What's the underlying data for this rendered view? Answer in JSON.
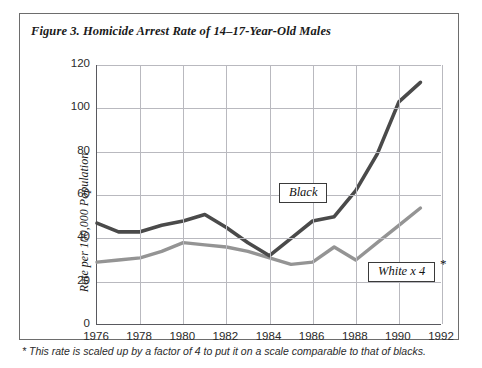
{
  "figure": {
    "title": "Figure 3. Homicide Arrest Rate of 14–17-Year-Old Males",
    "footnote": "* This rate is scaled up by a factor of 4 to put it on a scale comparable to that of blacks."
  },
  "labels": {
    "black": "Black",
    "white": "White x 4",
    "white_asterisk": "*"
  },
  "colors": {
    "black_series": "#4a4a4a",
    "white_series": "#949494",
    "grid": "#b9b9bf",
    "axis": "#59595f",
    "frame": "#6d6d6d",
    "text": "#1a1a1a"
  },
  "chart_data": {
    "type": "line",
    "title": "Figure 3. Homicide Arrest Rate of 14–17-Year-Old Males",
    "xlabel": "",
    "ylabel": "Rate per 100,000 Population",
    "xlim": [
      1976,
      1992
    ],
    "ylim": [
      0,
      120
    ],
    "ytick_labels": [
      "0",
      "20",
      "40",
      "60",
      "80",
      "100",
      "120"
    ],
    "yticks": [
      0,
      20,
      40,
      60,
      80,
      100,
      120
    ],
    "xtick_labels": [
      "1976",
      "1978",
      "1980",
      "1982",
      "1984",
      "1986",
      "1988",
      "1990",
      "1992"
    ],
    "xticks": [
      1976,
      1978,
      1980,
      1982,
      1984,
      1986,
      1988,
      1990,
      1992
    ],
    "grid": true,
    "legend": "inline-boxed-annotations",
    "x": [
      1976,
      1977,
      1978,
      1979,
      1980,
      1981,
      1982,
      1983,
      1984,
      1985,
      1986,
      1987,
      1988,
      1989,
      1990,
      1991
    ],
    "series": [
      {
        "name": "Black",
        "color": "#4a4a4a",
        "values": [
          47,
          43,
          43,
          46,
          48,
          51,
          45,
          38,
          32,
          40,
          48,
          50,
          62,
          79,
          103,
          112
        ]
      },
      {
        "name": "White x 4",
        "color": "#949494",
        "values": [
          29,
          30,
          31,
          34,
          38,
          37,
          36,
          34,
          31,
          28,
          29,
          36,
          30,
          38,
          46,
          54
        ]
      }
    ],
    "annotations": [
      {
        "text": "Black",
        "x": 1985.0,
        "y": 57,
        "boxed": true
      },
      {
        "text": "White x 4",
        "x": 1989.0,
        "y": 22,
        "boxed": true
      }
    ]
  }
}
